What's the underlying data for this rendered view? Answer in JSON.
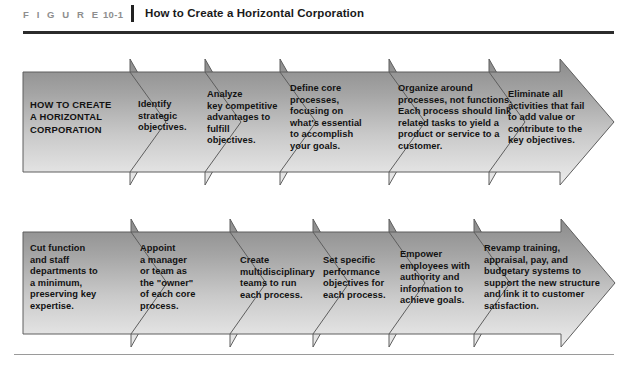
{
  "figure": {
    "label": "F I G U R E",
    "number": "10-1",
    "title": "How to Create a Horizontal Corporation"
  },
  "colors": {
    "band_dark": "#8d8d8d",
    "band_light": "#e9e9e9",
    "outline": "#5a5a5a",
    "rule_dark": "#2b2b2b",
    "rule_light": "#9a9a9a",
    "label_gray": "#8e8e8e",
    "text_black": "#121212"
  },
  "diagram": {
    "type": "chevron-process-flow",
    "rows": [
      {
        "name": "row-1",
        "segments": [
          {
            "id": "r1s1",
            "label": "HOW TO CREATE\nA HORIZONTAL\nCORPORATION",
            "is_lead": true
          },
          {
            "id": "r1s2",
            "label": "Identify\nstrategic\nobjectives.",
            "is_lead": false
          },
          {
            "id": "r1s3",
            "label": "Analyze\nkey competitive\nadvantages to\nfulfill\nobjectives.",
            "is_lead": false
          },
          {
            "id": "r1s4",
            "label": "Define core\nprocesses,\nfocusing on\nwhat's essential\nto accomplish\nyour goals.",
            "is_lead": false
          },
          {
            "id": "r1s5",
            "label": "Organize around\nprocesses, not functions.\nEach process should link\nrelated tasks to yield a\nproduct or service to a\ncustomer.",
            "is_lead": false
          },
          {
            "id": "r1s6",
            "label": "Eliminate all\nactivities that fail\nto add value or\ncontribute to the\nkey objectives.",
            "is_lead": false
          }
        ]
      },
      {
        "name": "row-2",
        "segments": [
          {
            "id": "r2s1",
            "label": "Cut function\nand staff\ndepartments to\na minimum,\npreserving key\nexpertise.",
            "is_lead": false
          },
          {
            "id": "r2s2",
            "label": "Appoint\na manager\nor team as\nthe \"owner\"\nof each core\nprocess.",
            "is_lead": false
          },
          {
            "id": "r2s3",
            "label": "Create\nmultidisciplinary\nteams to run\neach process.",
            "is_lead": false
          },
          {
            "id": "r2s4",
            "label": "Set specific\nperformance\nobjectives for\neach process.",
            "is_lead": false
          },
          {
            "id": "r2s5",
            "label": "Empower\nemployees with\nauthority and\ninformation to\nachieve goals.",
            "is_lead": false
          },
          {
            "id": "r2s6",
            "label": "Revamp training,\nappraisal, pay, and\nbudgetary systems to\nsupport the new structure\nand link it to customer\nsatisfaction.",
            "is_lead": false
          }
        ]
      }
    ]
  }
}
